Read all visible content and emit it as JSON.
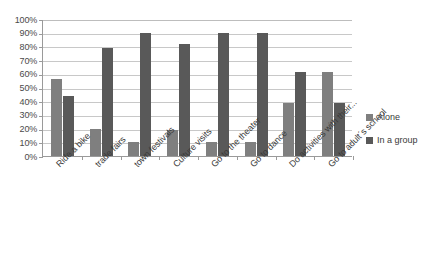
{
  "chart_data": {
    "type": "bar",
    "title": "",
    "subtitle": "",
    "xlabel": "",
    "ylabel": "",
    "ylim": [
      0,
      100
    ],
    "grid": true,
    "legend_position": "right",
    "categories": [
      "Ride a bike",
      "trade fairs",
      "town festivals",
      "Culture visits",
      "Go to the theater",
      "Go to dance",
      "Do activities with their...",
      "Go to adult´s school"
    ],
    "series": [
      {
        "name": "Alone",
        "color": "#7f7f7f",
        "values": [
          56,
          20,
          10,
          19,
          10,
          10,
          39,
          61
        ]
      },
      {
        "name": "In a group",
        "color": "#595959",
        "values": [
          44,
          79,
          90,
          82,
          90,
          90,
          61,
          39
        ]
      }
    ],
    "y_ticks": [
      "0%",
      "10%",
      "20%",
      "30%",
      "40%",
      "50%",
      "60%",
      "70%",
      "80%",
      "90%",
      "100%"
    ],
    "y_tick_values": [
      0,
      10,
      20,
      30,
      40,
      50,
      60,
      70,
      80,
      90,
      100
    ]
  },
  "legend": {
    "items": [
      {
        "label": "Alone"
      },
      {
        "label": "In a group"
      }
    ]
  }
}
